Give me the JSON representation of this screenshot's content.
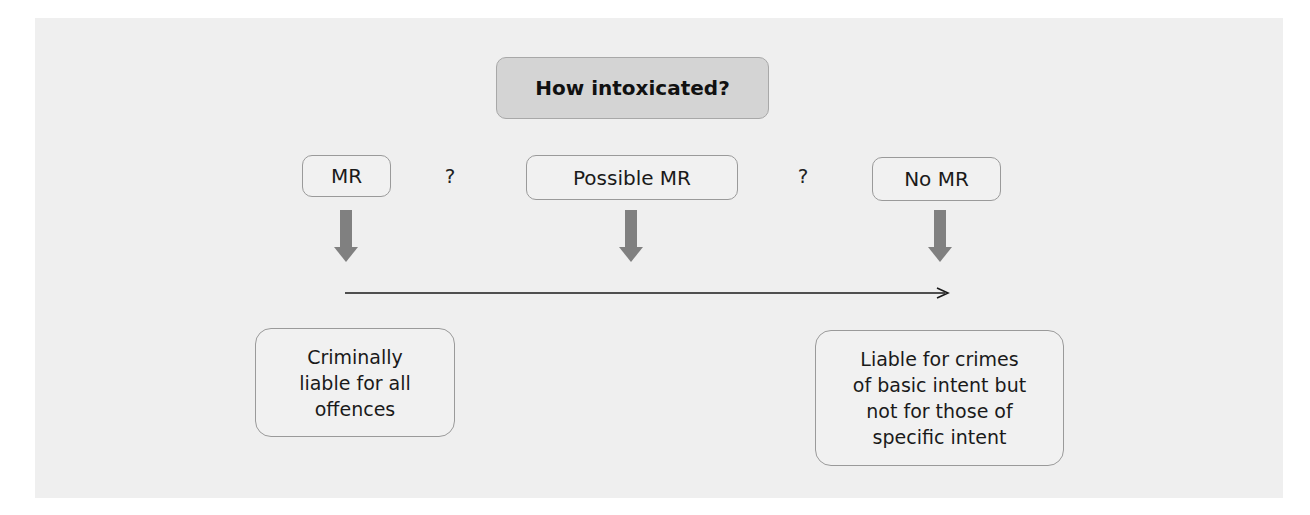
{
  "diagram": {
    "title": "How intoxicated?",
    "levels": [
      {
        "label": "MR"
      },
      {
        "label": "Possible MR"
      },
      {
        "label": "No MR"
      }
    ],
    "separators": [
      "?",
      "?"
    ],
    "outcomes": [
      {
        "lines": [
          "Criminally",
          "liable for all",
          "offences"
        ]
      },
      {
        "lines": [
          "Liable for crimes",
          "of basic intent but",
          "not for those of",
          "specific intent"
        ]
      }
    ],
    "colors": {
      "panel_background": "#efefef",
      "title_fill": "#d4d4d4",
      "box_border": "#9a9a9a",
      "arrow_fill": "#808080",
      "line_color": "#1a1a1a"
    }
  }
}
